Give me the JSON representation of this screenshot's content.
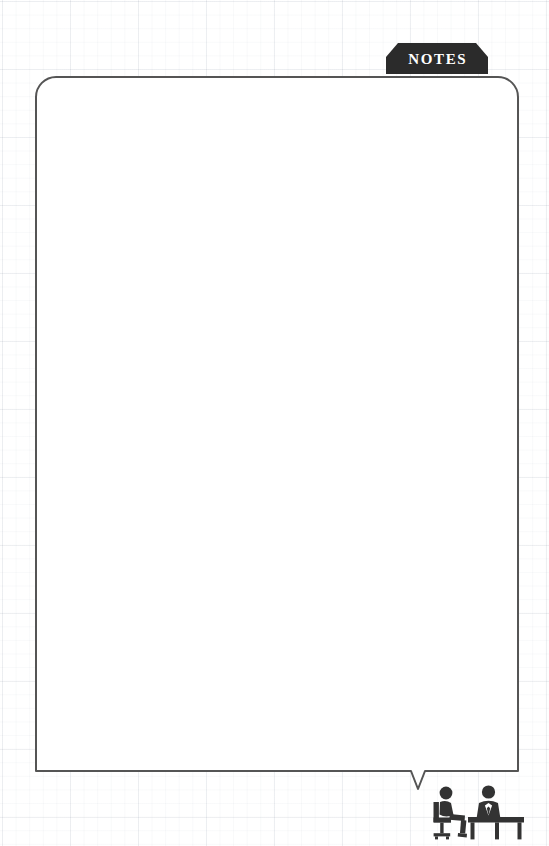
{
  "page": {
    "background": "#ffffff",
    "grid_color": "#96a0af",
    "width": 549,
    "height": 846
  },
  "tab": {
    "label": "NOTES",
    "fill_color": "#2b2b2b",
    "text_color": "#ffffff",
    "icon": "notes-tab-banner"
  },
  "card": {
    "border_color": "#555555",
    "fill_color": "#ffffff",
    "shape": "rounded-speech-bubble",
    "tail": "bottom-right-pointer",
    "lines": [
      "",
      "",
      "",
      "",
      "",
      "",
      "",
      "",
      "",
      "",
      "",
      "",
      "",
      "",
      "",
      "",
      "",
      "",
      "",
      "",
      "",
      "",
      "",
      "",
      "",
      "",
      "",
      "",
      "",
      "",
      "",
      "",
      ""
    ]
  },
  "decoration": {
    "icon_name": "interview-meeting-icon",
    "color": "#333333",
    "parts": [
      "seated-person-on-office-chair",
      "person-in-suit-behind-desk"
    ]
  }
}
